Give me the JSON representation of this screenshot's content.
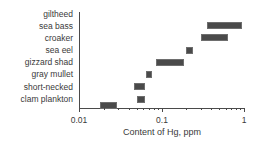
{
  "chart_data": {
    "type": "bar",
    "title": "",
    "subtitle": "",
    "xlabel": "Content of Hg, ppm",
    "ylabel": "",
    "xscale": "log",
    "xlim": [
      0.01,
      1
    ],
    "grid": false,
    "legend": null,
    "orientation": "horizontal",
    "bar_style": "range-bar (min-max interval)",
    "categories": [
      "giltheed",
      "sea bass",
      "croaker",
      "sea eel",
      "gizzard shad",
      "gray mullet",
      "short-necked",
      "clam plankton"
    ],
    "x_tick_labels": [
      "0.01",
      "0.1",
      "1"
    ],
    "x_tick_values": [
      0.01,
      0.1,
      1
    ],
    "ranges": [
      {
        "category": "giltheed",
        "low": 0.36,
        "high": 0.95
      },
      {
        "category": "sea bass",
        "low": 0.3,
        "high": 0.64
      },
      {
        "category": "croaker",
        "low": 0.2,
        "high": 0.24
      },
      {
        "category": "sea eel",
        "low": 0.086,
        "high": 0.19
      },
      {
        "category": "gizzard shad",
        "low": 0.065,
        "high": 0.077
      },
      {
        "category": "gray mullet",
        "low": 0.046,
        "high": 0.063
      },
      {
        "category": "short-necked",
        "low": 0.05,
        "high": 0.063
      },
      {
        "category": "clam plankton",
        "low": 0.018,
        "high": 0.029
      }
    ],
    "series": [
      {
        "name": "low",
        "values": [
          0.36,
          0.3,
          0.2,
          0.086,
          0.065,
          0.046,
          0.05,
          0.018
        ]
      },
      {
        "name": "high",
        "values": [
          0.95,
          0.64,
          0.24,
          0.19,
          0.077,
          0.063,
          0.063,
          0.029
        ]
      }
    ],
    "colors": {
      "bar_fill": "#4a4a4a",
      "bar_edge": "#6e6e6e",
      "axis": "#4a4a4a",
      "text": "#3a3a3a",
      "background": "#ffffff"
    }
  }
}
